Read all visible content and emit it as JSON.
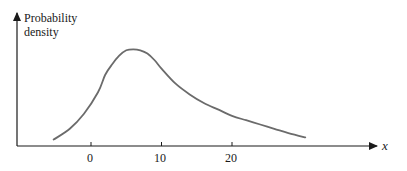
{
  "chart_data": {
    "type": "line",
    "title": "",
    "xlabel": "x",
    "ylabel": "Probability density",
    "ylabel_lines": [
      "Probability",
      "density"
    ],
    "x_ticks": [
      0,
      10,
      20
    ],
    "x_tick_labels": [
      "0",
      "10",
      "20"
    ],
    "y_ticks": [],
    "xlim": [
      -10.5,
      42
    ],
    "grid": false,
    "legend": null,
    "series": [
      {
        "name": "Probability density",
        "color": "#6b6b6b",
        "points": [
          [
            -5.3,
            0.03
          ],
          [
            -3,
            0.08
          ],
          [
            -1,
            0.15
          ],
          [
            1,
            0.25
          ],
          [
            2,
            0.33
          ],
          [
            3,
            0.38
          ],
          [
            4,
            0.42
          ],
          [
            5,
            0.445
          ],
          [
            6,
            0.45
          ],
          [
            7,
            0.445
          ],
          [
            8,
            0.43
          ],
          [
            9,
            0.4
          ],
          [
            10,
            0.36
          ],
          [
            12,
            0.29
          ],
          [
            14,
            0.24
          ],
          [
            16,
            0.2
          ],
          [
            18,
            0.17
          ],
          [
            20,
            0.14
          ],
          [
            22,
            0.12
          ],
          [
            24,
            0.1
          ],
          [
            26,
            0.08
          ],
          [
            28,
            0.06
          ],
          [
            30.4,
            0.04
          ]
        ]
      }
    ]
  }
}
